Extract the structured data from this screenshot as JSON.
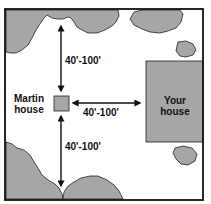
{
  "diagram": {
    "colors": {
      "frame": "#111111",
      "fill": "#a6a6a6",
      "outline": "#222222",
      "background": "#ffffff"
    },
    "labels": {
      "martin_house_line1": "Martin",
      "martin_house_line2": "house",
      "your_house_line1": "Your",
      "your_house_line2": "house",
      "distance_top": "40'-100'",
      "distance_right": "40'-100'",
      "distance_bottom": "40'-100'"
    }
  }
}
